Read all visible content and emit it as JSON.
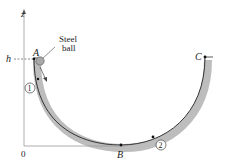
{
  "diagram": {
    "axis_vertical_label": "z",
    "origin_label": "0",
    "height_label": "h",
    "ball_label_line1": "Steel",
    "ball_label_line2": "ball",
    "points": {
      "A": "A",
      "B": "B",
      "C": "C"
    },
    "positions": {
      "p1": "1",
      "p2": "2"
    },
    "colors": {
      "track": "#bdbdbd",
      "line": "#333333",
      "ball": "#a8a8a8"
    }
  }
}
